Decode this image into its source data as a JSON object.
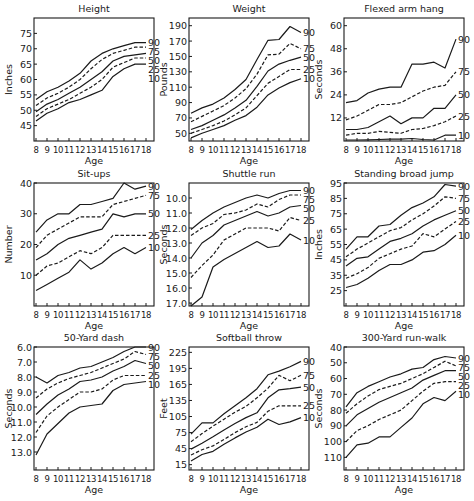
{
  "figure": {
    "x_label": "Age",
    "x_ticks": [
      8,
      9,
      10,
      11,
      12,
      13,
      14,
      15,
      16,
      17,
      18
    ],
    "percentile_labels": [
      "90",
      "75",
      "50",
      "25",
      "10"
    ],
    "line_styles": {
      "90": "solid",
      "75": "dashed",
      "50": "solid",
      "25": "dashed",
      "10": "solid"
    },
    "line_color": "#1a1a1a"
  },
  "chart_data": [
    {
      "type": "line",
      "title": "Height",
      "xlabel": "Age",
      "ylabel": "Inches",
      "yticks": [
        45,
        50,
        55,
        60,
        65,
        70,
        75
      ],
      "ylim": [
        40,
        80
      ],
      "inverted": false,
      "x": [
        8,
        9,
        10,
        11,
        12,
        13,
        14,
        15,
        16,
        17,
        18
      ],
      "series": [
        {
          "name": "90",
          "values": [
            53.5,
            56,
            57.5,
            59.5,
            62,
            66,
            68.5,
            70,
            71,
            72,
            72
          ]
        },
        {
          "name": "75",
          "values": [
            51.5,
            54,
            55.5,
            57.5,
            60,
            63.5,
            66.5,
            68.5,
            69.5,
            70.5,
            70.5
          ]
        },
        {
          "name": "50",
          "values": [
            49.5,
            52,
            53.5,
            55.5,
            57.5,
            60,
            62.5,
            66,
            67.5,
            68,
            68.5
          ]
        },
        {
          "name": "25",
          "values": [
            48,
            50.5,
            52,
            53.5,
            55.5,
            57.5,
            60,
            64,
            65.5,
            67,
            67
          ]
        },
        {
          "name": "10",
          "values": [
            46.5,
            49,
            50.5,
            52.5,
            53.5,
            55,
            56.5,
            61,
            63.5,
            65,
            65
          ]
        }
      ]
    },
    {
      "type": "line",
      "title": "Weight",
      "xlabel": "Age",
      "ylabel": "Pounds",
      "yticks": [
        50,
        70,
        90,
        110,
        130,
        150,
        170,
        190
      ],
      "ylim": [
        40,
        200
      ],
      "inverted": false,
      "x": [
        8,
        9,
        10,
        11,
        12,
        13,
        14,
        15,
        16,
        17,
        18
      ],
      "series": [
        {
          "name": "90",
          "values": [
            76,
            83,
            88,
            96,
            107,
            120,
            146,
            171,
            172,
            189,
            181
          ]
        },
        {
          "name": "75",
          "values": [
            65,
            72,
            79,
            86,
            96,
            108,
            127,
            152,
            153,
            167,
            160
          ]
        },
        {
          "name": "50",
          "values": [
            55,
            60,
            67,
            74,
            83,
            93,
            111,
            131,
            140,
            145,
            149
          ]
        },
        {
          "name": "25",
          "values": [
            50,
            55,
            60,
            66,
            74,
            83,
            99,
            115,
            124,
            133,
            133
          ]
        },
        {
          "name": "10",
          "values": [
            44,
            50,
            55,
            60,
            67,
            73,
            84,
            100,
            109,
            116,
            121
          ]
        }
      ]
    },
    {
      "type": "line",
      "title": "Flexed arm hang",
      "xlabel": "Age",
      "ylabel": "Seconds",
      "yticks": [
        12,
        24,
        36,
        48,
        60
      ],
      "ylim": [
        0,
        64
      ],
      "inverted": false,
      "x": [
        8,
        9,
        10,
        11,
        12,
        13,
        14,
        15,
        16,
        17,
        18
      ],
      "series": [
        {
          "name": "90",
          "values": [
            20,
            21,
            25,
            27,
            28,
            28,
            40,
            40,
            41,
            38,
            53
          ]
        },
        {
          "name": "75",
          "values": [
            11,
            13,
            16,
            19,
            19,
            20,
            23,
            26,
            28,
            29,
            36
          ]
        },
        {
          "name": "50",
          "values": [
            6,
            6,
            7,
            10,
            13,
            9,
            12,
            12,
            17,
            17,
            24
          ]
        },
        {
          "name": "25",
          "values": [
            3,
            4,
            4,
            5,
            4.5,
            4,
            6,
            6.5,
            8,
            10,
            13
          ]
        },
        {
          "name": "10",
          "values": [
            0.5,
            0.5,
            0.6,
            0.8,
            1,
            1,
            1.3,
            0.8,
            0.5,
            3,
            3
          ]
        }
      ]
    },
    {
      "type": "line",
      "title": "Sit-ups",
      "xlabel": "Age",
      "ylabel": "Number",
      "yticks": [
        10,
        20,
        30,
        40
      ],
      "ylim": [
        0,
        40
      ],
      "inverted": false,
      "x": [
        8,
        9,
        10,
        11,
        12,
        13,
        14,
        15,
        16,
        17,
        18
      ],
      "series": [
        {
          "name": "90",
          "values": [
            24,
            28,
            30,
            30,
            33,
            33,
            34,
            35,
            40,
            38,
            39
          ]
        },
        {
          "name": "75",
          "values": [
            19,
            23,
            25,
            27,
            29,
            29,
            29,
            33,
            34,
            35,
            36
          ]
        },
        {
          "name": "50",
          "values": [
            15,
            17,
            20,
            22,
            23,
            24,
            25,
            30,
            29,
            30,
            30
          ]
        },
        {
          "name": "25",
          "values": [
            10,
            13,
            14,
            16,
            18,
            17,
            19,
            23,
            23,
            23,
            23
          ]
        },
        {
          "name": "10",
          "values": [
            5,
            7,
            9,
            11,
            15,
            12,
            14,
            17,
            19,
            17,
            19
          ]
        }
      ]
    },
    {
      "type": "line",
      "title": "Shuttle run",
      "xlabel": "Age",
      "ylabel": "Seconds",
      "yticks": [
        10.0,
        11.0,
        12.0,
        13.0,
        14.0,
        15.0,
        16.0,
        17.0
      ],
      "ytick_labels": [
        "10.0",
        "11.0",
        "12.0",
        "13.0",
        "14.0",
        "15.0",
        "16.0",
        "17.0"
      ],
      "ylim": [
        9.0,
        17.2
      ],
      "inverted": true,
      "x": [
        8,
        9,
        10,
        11,
        12,
        13,
        14,
        15,
        16,
        17,
        18
      ],
      "series": [
        {
          "name": "90",
          "values": [
            12.1,
            11.5,
            11.0,
            10.6,
            10.3,
            10.0,
            9.8,
            10.0,
            9.7,
            9.5,
            9.5
          ]
        },
        {
          "name": "75",
          "values": [
            12.5,
            12.0,
            11.7,
            11.1,
            11.0,
            10.8,
            10.4,
            10.6,
            10.1,
            9.8,
            9.8
          ]
        },
        {
          "name": "50",
          "values": [
            14.0,
            13.0,
            12.5,
            11.8,
            11.5,
            11.2,
            10.9,
            11.2,
            11.0,
            10.6,
            10.5
          ]
        },
        {
          "name": "25",
          "values": [
            15.3,
            14.5,
            13.8,
            12.8,
            12.4,
            12.0,
            12.0,
            12.0,
            12.2,
            11.3,
            11.5
          ]
        },
        {
          "name": "10",
          "values": [
            17.2,
            16.6,
            14.6,
            14.1,
            13.7,
            13.3,
            12.9,
            13.3,
            13.2,
            12.4,
            12.8
          ]
        }
      ]
    },
    {
      "type": "line",
      "title": "Standing broad jump",
      "xlabel": "Age",
      "ylabel": "Inches",
      "yticks": [
        25,
        35,
        45,
        55,
        65,
        75,
        85,
        95
      ],
      "ylim": [
        15,
        95
      ],
      "inverted": false,
      "x": [
        8,
        9,
        10,
        11,
        12,
        13,
        14,
        15,
        16,
        17,
        18
      ],
      "series": [
        {
          "name": "90",
          "values": [
            52,
            60,
            60,
            67,
            68,
            74,
            79,
            82,
            86,
            94,
            93
          ]
        },
        {
          "name": "75",
          "values": [
            47,
            52,
            56,
            60,
            64,
            66,
            71,
            75,
            80,
            86,
            85
          ]
        },
        {
          "name": "50",
          "values": [
            41,
            46,
            47,
            52,
            57,
            59,
            62,
            67,
            71,
            74,
            77
          ]
        },
        {
          "name": "25",
          "values": [
            33,
            36,
            40,
            46,
            49,
            52,
            54,
            62,
            60,
            65,
            70
          ]
        },
        {
          "name": "10",
          "values": [
            27,
            29,
            33,
            38,
            42,
            42,
            45,
            50,
            51,
            55,
            61
          ]
        }
      ]
    },
    {
      "type": "line",
      "title": "50-Yard dash",
      "xlabel": "Age",
      "ylabel": "Seconds",
      "yticks": [
        6.0,
        7.0,
        8.0,
        9.0,
        10.0,
        11.0,
        12.0,
        13.0
      ],
      "ytick_labels": [
        "6.0",
        "7.0",
        "8.0",
        "9.0",
        "10.0",
        "11.0",
        "12.0",
        "13.0"
      ],
      "ylim": [
        6.0,
        14.2
      ],
      "inverted": true,
      "x": [
        8,
        9,
        10,
        11,
        12,
        13,
        14,
        15,
        16,
        17,
        18
      ],
      "series": [
        {
          "name": "90",
          "values": [
            8.0,
            8.4,
            7.9,
            7.7,
            7.4,
            7.3,
            7.0,
            6.7,
            6.3,
            6.0,
            6.0
          ]
        },
        {
          "name": "75",
          "values": [
            9.4,
            8.8,
            8.4,
            8.1,
            7.9,
            7.7,
            7.4,
            7.1,
            6.8,
            6.3,
            6.5
          ]
        },
        {
          "name": "50",
          "values": [
            10.5,
            9.8,
            9.2,
            8.8,
            8.3,
            8.2,
            8.0,
            7.6,
            7.3,
            6.9,
            7.1
          ]
        },
        {
          "name": "25",
          "values": [
            11.7,
            10.6,
            10.0,
            9.5,
            9.0,
            9.0,
            8.8,
            8.2,
            7.9,
            7.9,
            7.9
          ]
        },
        {
          "name": "10",
          "values": [
            13.2,
            11.8,
            11.1,
            10.4,
            10.0,
            9.9,
            9.8,
            8.9,
            8.5,
            8.4,
            8.3
          ]
        }
      ]
    },
    {
      "type": "line",
      "title": "Softball throw",
      "xlabel": "Age",
      "ylabel": "Feet",
      "yticks": [
        15,
        45,
        75,
        105,
        135,
        165,
        195,
        225
      ],
      "ylim": [
        5,
        235
      ],
      "inverted": false,
      "x": [
        8,
        9,
        10,
        11,
        12,
        13,
        14,
        15,
        16,
        17,
        18
      ],
      "series": [
        {
          "name": "90",
          "values": [
            72,
            93,
            93,
            110,
            125,
            140,
            157,
            183,
            190,
            198,
            208
          ]
        },
        {
          "name": "75",
          "values": [
            58,
            73,
            87,
            100,
            113,
            124,
            140,
            158,
            182,
            172,
            182
          ]
        },
        {
          "name": "50",
          "values": [
            44,
            55,
            67,
            80,
            92,
            103,
            112,
            140,
            155,
            157,
            160
          ]
        },
        {
          "name": "25",
          "values": [
            33,
            43,
            50,
            62,
            75,
            86,
            94,
            115,
            125,
            125,
            125
          ]
        },
        {
          "name": "10",
          "values": [
            22,
            34,
            40,
            53,
            65,
            76,
            85,
            100,
            90,
            95,
            103
          ]
        }
      ]
    },
    {
      "type": "line",
      "title": "300-Yard run-walk",
      "xlabel": "Age",
      "ylabel": "Seconds",
      "yticks": [
        40,
        50,
        60,
        70,
        80,
        90,
        100,
        110
      ],
      "ylim": [
        40,
        118
      ],
      "inverted": true,
      "x": [
        8,
        9,
        10,
        11,
        12,
        13,
        14,
        15,
        16,
        17,
        18
      ],
      "series": [
        {
          "name": "90",
          "values": [
            78,
            69,
            65,
            62,
            59,
            57,
            54,
            53,
            48,
            46,
            47
          ]
        },
        {
          "name": "75",
          "values": [
            82,
            76,
            71,
            67,
            65,
            63,
            60,
            57,
            53,
            49,
            52
          ]
        },
        {
          "name": "50",
          "values": [
            90,
            83,
            79,
            75,
            72,
            69,
            66,
            61,
            58,
            55,
            55
          ]
        },
        {
          "name": "25",
          "values": [
            100,
            93,
            90,
            86,
            83,
            80,
            74,
            68,
            63,
            62,
            62
          ]
        },
        {
          "name": "10",
          "values": [
            110,
            102,
            101,
            97,
            97,
            91,
            85,
            76,
            72,
            74,
            68
          ]
        }
      ]
    }
  ]
}
